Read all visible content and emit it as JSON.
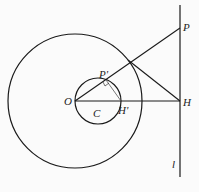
{
  "diagram": {
    "labels": {
      "O": "O",
      "C": "C",
      "P": "P",
      "P_prime": "P'",
      "H": "H",
      "H_prime": "H'",
      "l": "l"
    },
    "colors": {
      "stroke": "#1a1a1a",
      "background": "#fbfbfb"
    }
  }
}
